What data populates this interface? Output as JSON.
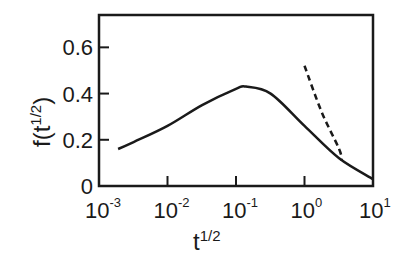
{
  "chart_data": {
    "type": "line",
    "title": "",
    "xlabel": "t^{1/2}",
    "ylabel": "f(t^{1/2})",
    "xscale": "log",
    "xlim": [
      0.001,
      10
    ],
    "ylim": [
      0,
      0.74
    ],
    "grid": false,
    "legend": null,
    "x_ticks": [
      {
        "value": 0.001,
        "base": "10",
        "exp": "-3"
      },
      {
        "value": 0.01,
        "base": "10",
        "exp": "-2"
      },
      {
        "value": 0.1,
        "base": "10",
        "exp": "-1"
      },
      {
        "value": 1,
        "base": "10",
        "exp": "0"
      },
      {
        "value": 10,
        "base": "10",
        "exp": "1"
      }
    ],
    "y_ticks": [
      {
        "value": 0,
        "label": "0"
      },
      {
        "value": 0.2,
        "label": "0.2"
      },
      {
        "value": 0.4,
        "label": "0.4"
      },
      {
        "value": 0.6,
        "label": "0.6"
      }
    ],
    "series": [
      {
        "name": "solid",
        "style": "solid",
        "x": [
          0.0019,
          0.0032,
          0.01,
          0.032,
          0.1,
          0.14,
          0.32,
          1,
          3.2,
          10
        ],
        "y": [
          0.16,
          0.19,
          0.26,
          0.35,
          0.42,
          0.43,
          0.4,
          0.26,
          0.12,
          0.03
        ]
      },
      {
        "name": "dashed",
        "style": "dashed",
        "x": [
          1,
          1.78,
          3.2,
          3.5
        ],
        "y": [
          0.52,
          0.32,
          0.16,
          0.11
        ]
      }
    ]
  },
  "labels": {
    "xlabel_base": "t",
    "xlabel_exp": "1/2",
    "ylabel_prefix": "f(t",
    "ylabel_exp": "1/2",
    "ylabel_suffix": ")"
  }
}
